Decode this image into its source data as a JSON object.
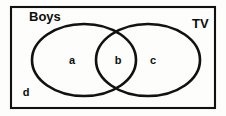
{
  "diagram": {
    "kind": "venn-diagram",
    "universe": {
      "name": "universal-set-rectangle",
      "x": 11,
      "y": 7,
      "width": 204,
      "height": 101
    },
    "sets": [
      {
        "id": "boys",
        "label": "Boys",
        "label_x": 29,
        "label_y": 18,
        "cx": 84,
        "cy": 60,
        "rx": 52,
        "ry": 36
      },
      {
        "id": "tv",
        "label": "TV",
        "label_x": 192,
        "label_y": 25,
        "cx": 148,
        "cy": 60,
        "rx": 52,
        "ry": 36
      }
    ],
    "regions": [
      {
        "id": "region-a",
        "label": "a",
        "x": 72,
        "y": 61
      },
      {
        "id": "region-b",
        "label": "b",
        "x": 118,
        "y": 61
      },
      {
        "id": "region-c",
        "label": "c",
        "x": 153,
        "y": 61
      },
      {
        "id": "region-d",
        "label": "d",
        "x": 26,
        "y": 93
      }
    ],
    "colors": {
      "stroke": "#111111",
      "background": "#fdfdfb",
      "text": "#0d0d0d"
    }
  }
}
